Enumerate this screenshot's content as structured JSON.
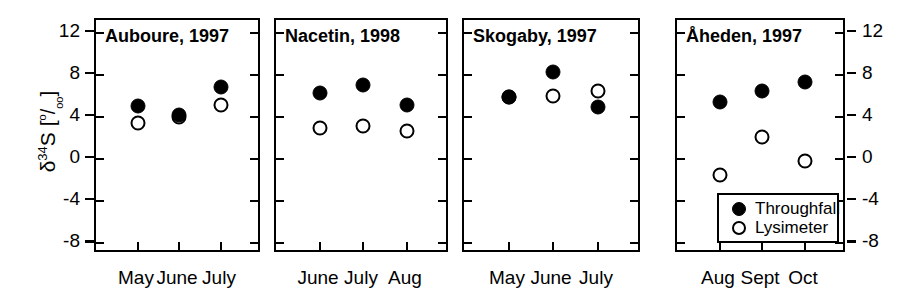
{
  "figure": {
    "width": 897,
    "height": 303,
    "background": "#ffffff",
    "foreground": "#000000"
  },
  "axis": {
    "ylabel_delta": "δ",
    "ylabel_sup": "34",
    "ylabel_element": "S [",
    "ylabel_permil_top": "o",
    "ylabel_permil_slash": "/",
    "ylabel_permil_bottom": "oo",
    "ylabel_close": "]",
    "ylabel_plain": "δ34S [o/oo]",
    "yticks": [
      12,
      8,
      4,
      0,
      -4,
      -8
    ],
    "ytick_labels": [
      "12",
      "8",
      "4",
      "0",
      "-4",
      "-8"
    ],
    "ylim": [
      -9.0,
      13.2
    ],
    "left_axis_labels_shown": true,
    "right_axis_labels_shown": true
  },
  "legend": {
    "position": "inside-panel-4-bottom-right",
    "entries": [
      {
        "label": "Throughfall",
        "marker": "filled-circle"
      },
      {
        "label": "Lysimeter",
        "marker": "open-circle"
      }
    ]
  },
  "chart_data": {
    "type": "scatter",
    "title": "",
    "xlabel": "",
    "ylabel": "δ34S [o/oo]",
    "ylim": [
      -9.0,
      13.2
    ],
    "yticks": [
      12,
      8,
      4,
      0,
      -4,
      -8
    ],
    "grid": false,
    "legend_position": "lower right of fourth panel",
    "series_names": [
      "Throughfall",
      "Lysimeter"
    ],
    "panels": [
      {
        "title": "Auboure, 1997",
        "site": "Auboure",
        "year": "1997",
        "categories": [
          "May",
          "June",
          "July"
        ],
        "series": [
          {
            "name": "Throughfall",
            "marker": "filled-circle",
            "values": [
              5.0,
              4.2,
              6.8
            ]
          },
          {
            "name": "Lysimeter",
            "marker": "open-circle",
            "values": [
              3.4,
              4.0,
              5.1
            ]
          }
        ]
      },
      {
        "title": "Nacetin, 1998",
        "site": "Nacetin",
        "year": "1998",
        "categories": [
          "June",
          "July",
          "Aug"
        ],
        "series": [
          {
            "name": "Throughfall",
            "marker": "filled-circle",
            "values": [
              6.3,
              7.0,
              5.1
            ]
          },
          {
            "name": "Lysimeter",
            "marker": "open-circle",
            "values": [
              3.0,
              3.1,
              2.7
            ]
          }
        ]
      },
      {
        "title": "Skogaby, 1997",
        "site": "Skogaby",
        "year": "1997",
        "categories": [
          "May",
          "June",
          "July"
        ],
        "series": [
          {
            "name": "Throughfall",
            "marker": "filled-circle",
            "values": [
              5.9,
              8.3,
              4.9
            ]
          },
          {
            "name": "Lysimeter",
            "marker": "open-circle",
            "values": [
              5.9,
              6.0,
              6.5
            ]
          }
        ]
      },
      {
        "title": "Åheden, 1997",
        "site": "Åheden",
        "year": "1997",
        "categories": [
          "Aug",
          "Sept",
          "Oct"
        ],
        "series": [
          {
            "name": "Throughfall",
            "marker": "filled-circle",
            "values": [
              5.4,
              6.5,
              7.3
            ]
          },
          {
            "name": "Lysimeter",
            "marker": "open-circle",
            "values": [
              -1.5,
              2.1,
              -0.2
            ]
          }
        ]
      }
    ]
  }
}
